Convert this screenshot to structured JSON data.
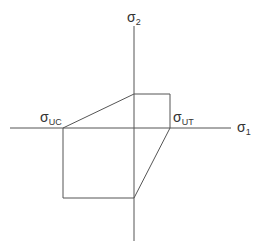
{
  "diagram": {
    "labels": {
      "sigma2": {
        "base": "σ",
        "sub": "2"
      },
      "sigma1": {
        "base": "σ",
        "sub": "1"
      },
      "sigma_uc": {
        "base": "σ",
        "sub": "UC"
      },
      "sigma_ut": {
        "base": "σ",
        "sub": "UT"
      }
    },
    "axes": {
      "origin": [
        134,
        128
      ],
      "horizontal": {
        "x1": 10,
        "x2": 231,
        "y": 128
      },
      "vertical": {
        "x": 134,
        "y1": 26,
        "y2": 241
      }
    },
    "envelope_points": [
      [
        63,
        128
      ],
      [
        134,
        94
      ],
      [
        170,
        94
      ],
      [
        170,
        128
      ],
      [
        134,
        198
      ],
      [
        63,
        198
      ]
    ],
    "colors": {
      "line": "#555555",
      "text": "#333333",
      "background": "#ffffff"
    }
  }
}
